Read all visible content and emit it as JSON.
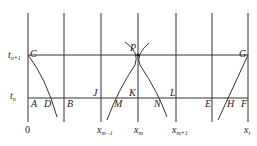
{
  "diagram": {
    "y_labels": {
      "t_top": "t",
      "t_top_sub": "n+1",
      "t_bottom": "t",
      "t_bottom_sub": "n"
    },
    "x_labels": {
      "origin": "0",
      "xm1": "x",
      "xm1_sub": "m−1",
      "xm": "x",
      "xm_sub": "m",
      "xp1": "x",
      "xp1_sub": "m+1",
      "xt": "x",
      "xt_sub": "t"
    },
    "points": {
      "C": "C",
      "P": "P",
      "G": "G",
      "A": "A",
      "D": "D",
      "B": "B",
      "J": "J",
      "M": "M",
      "K": "K",
      "N": "N",
      "L": "L",
      "E": "E",
      "H": "H",
      "F": "F"
    },
    "colors": {
      "line": "#333333",
      "background": "#ffffff"
    }
  }
}
